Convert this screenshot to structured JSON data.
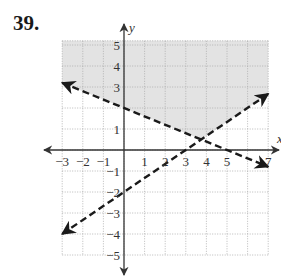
{
  "problem": {
    "number": "39."
  },
  "colors": {
    "shade": "#e3e3e3",
    "grid": "#a8a8a8",
    "axis": "#333333",
    "line": "#1a1a1a"
  },
  "chart_data": {
    "type": "line",
    "title": "",
    "xlabel": "x",
    "ylabel": "y",
    "xlim": [
      -3,
      7
    ],
    "ylim": [
      -5,
      5
    ],
    "grid": true,
    "x_tick_labels": [
      "-3",
      "-2",
      "-1",
      "1",
      "2",
      "3",
      "4",
      "5",
      "7"
    ],
    "y_tick_labels": [
      "5",
      "4",
      "3",
      "1",
      "-1",
      "-2",
      "-3",
      "-4",
      "-5"
    ],
    "series": [
      {
        "name": "boundary line 1",
        "equation": "y = -2/5 x + 2",
        "style": "dashed",
        "x": [
          -3,
          0,
          5,
          7
        ],
        "y": [
          3.2,
          2,
          0,
          -0.8
        ]
      },
      {
        "name": "boundary line 2",
        "equation": "y = 2/3 x - 2",
        "style": "dashed",
        "x": [
          -3,
          0,
          3,
          7
        ],
        "y": [
          -4,
          -2,
          0,
          2.67
        ]
      }
    ],
    "shaded_region": "above both dashed lines (y > -2/5 x + 2 and y > 2/3 x - 2)",
    "intersection": {
      "x": 3.75,
      "y": 0.5
    }
  }
}
